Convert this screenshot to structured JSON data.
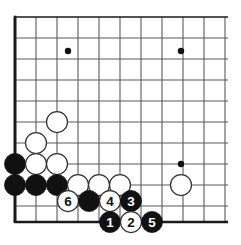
{
  "board": {
    "title": "Go board diagram - bottom left corner joseki sequence",
    "background_color": "#ffffff",
    "grid_line_color": "#5a5a5a",
    "border_line_color": "#1a1a1a",
    "star_point_color": "#111111",
    "black_stone_color": "#111111",
    "white_stone_color": "#ffffff",
    "white_stone_outline_color": "#333333",
    "origin_x": 15,
    "origin_y": 17,
    "spacing": 21,
    "cols": 11,
    "rows": 10,
    "grid_right_x": 228,
    "grid_bottom_y": 222,
    "stone_radius": 10.5,
    "border_width": 2.6,
    "grid_width": 1.1,
    "star_points": [
      {
        "name": "star-point-upper-left",
        "x": 68,
        "y": 51
      },
      {
        "name": "star-point-upper-right",
        "x": 181,
        "y": 51
      },
      {
        "name": "star-point-lower-right",
        "x": 181,
        "y": 164
      }
    ],
    "stones": [
      {
        "id": "white-stone-a",
        "color": "white",
        "x": 57,
        "y": 122,
        "label": ""
      },
      {
        "id": "white-stone-b",
        "color": "white",
        "x": 36,
        "y": 143,
        "label": ""
      },
      {
        "id": "black-stone-a",
        "color": "black",
        "x": 15,
        "y": 164,
        "label": ""
      },
      {
        "id": "white-stone-c",
        "color": "white",
        "x": 36,
        "y": 164,
        "label": ""
      },
      {
        "id": "white-stone-d",
        "color": "white",
        "x": 57,
        "y": 164,
        "label": ""
      },
      {
        "id": "black-stone-b",
        "color": "black",
        "x": 15,
        "y": 185,
        "label": ""
      },
      {
        "id": "black-stone-c",
        "color": "black",
        "x": 36,
        "y": 185,
        "label": ""
      },
      {
        "id": "black-stone-d",
        "color": "black",
        "x": 57,
        "y": 185,
        "label": ""
      },
      {
        "id": "white-stone-e",
        "color": "white",
        "x": 78,
        "y": 185,
        "label": ""
      },
      {
        "id": "white-stone-f",
        "color": "white",
        "x": 99,
        "y": 185,
        "label": ""
      },
      {
        "id": "white-stone-g",
        "color": "white",
        "x": 120,
        "y": 185,
        "label": ""
      },
      {
        "id": "white-stone-h",
        "color": "white",
        "x": 181,
        "y": 185,
        "label": ""
      },
      {
        "id": "move-6-white",
        "color": "white",
        "x": 68,
        "y": 201,
        "label": "6"
      },
      {
        "id": "black-stone-e",
        "color": "black",
        "x": 89,
        "y": 201,
        "label": ""
      },
      {
        "id": "move-4-white",
        "color": "white",
        "x": 110,
        "y": 201,
        "label": "4"
      },
      {
        "id": "move-3-black",
        "color": "black",
        "x": 131,
        "y": 201,
        "label": "3"
      },
      {
        "id": "move-1-black",
        "color": "black",
        "x": 110,
        "y": 222,
        "label": "1"
      },
      {
        "id": "move-2-white",
        "color": "white",
        "x": 131,
        "y": 222,
        "label": "2"
      },
      {
        "id": "move-5-black",
        "color": "black",
        "x": 152,
        "y": 222,
        "label": "5"
      }
    ],
    "move_labels": [
      "1",
      "2",
      "3",
      "4",
      "5",
      "6"
    ]
  }
}
